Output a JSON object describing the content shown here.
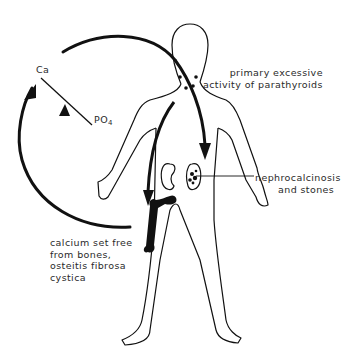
{
  "diagram": {
    "type": "physiological-pathway",
    "labels": {
      "ca": "Ca",
      "po4_main": "PO",
      "po4_sub": "4",
      "parathyroids_line1": "primary excessive",
      "parathyroids_line2": "activity of parathyroids",
      "nephro_line1": "nephrocalcinosis",
      "nephro_line2": "and stones",
      "bones_line1": "calcium set free",
      "bones_line2": "from bones,",
      "bones_line3": "osteitis fibrosa",
      "bones_line4": "cystica"
    },
    "elements": [
      {
        "id": "body-outline",
        "desc": "human figure outline"
      },
      {
        "id": "parathyroid-glands",
        "desc": "dots at neck"
      },
      {
        "id": "kidneys",
        "desc": "two kidneys, right one with stones"
      },
      {
        "id": "femur",
        "desc": "black bone in left thigh"
      },
      {
        "id": "cycle-arrow",
        "desc": "large circular arrow from body back to Ca"
      },
      {
        "id": "neck-to-kidney-arrow",
        "desc": "arrow from parathyroids to kidney"
      },
      {
        "id": "shoulder-to-bone-arrow",
        "desc": "arrow from shoulder down to bone"
      },
      {
        "id": "ca-po4-balance",
        "desc": "see-saw line Ca/PO4 with fulcrum triangle"
      }
    ],
    "colors": {
      "ink": "#111111",
      "text": "#2a2a2a",
      "background": "#ffffff"
    }
  }
}
